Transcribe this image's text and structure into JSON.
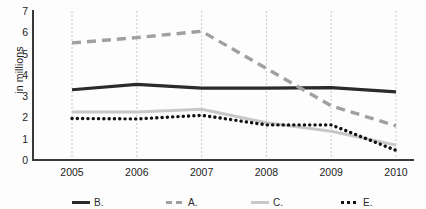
{
  "chart_data": {
    "type": "line",
    "title": "",
    "subtitle": "",
    "xlabel": "",
    "ylabel": "in millions",
    "categories": [
      "2005",
      "2006",
      "2007",
      "2008",
      "2009",
      "2010"
    ],
    "x": [
      2005,
      2006,
      2007,
      2008,
      2009,
      2010
    ],
    "ylim": [
      0,
      7
    ],
    "xlim": [
      2005,
      2010
    ],
    "yticks": [
      0,
      1,
      2,
      3,
      4,
      5,
      6,
      7
    ],
    "ytick_labels": [
      "0",
      "1",
      "2",
      "3",
      "4",
      "5",
      "6",
      "7"
    ],
    "xtick_labels": [
      "2005",
      "2006",
      "2007",
      "2008",
      "2009",
      "2010"
    ],
    "grid": "vertical-dashed-light",
    "legend_position": "bottom",
    "series": [
      {
        "name": "B.",
        "style": "solid",
        "color": "#2b2b2b",
        "width": 3.2,
        "values": [
          3.3,
          3.55,
          3.38,
          3.38,
          3.4,
          3.2
        ]
      },
      {
        "name": "A.",
        "style": "dashed",
        "color": "#a0a0a0",
        "width": 3.4,
        "values": [
          5.5,
          5.75,
          6.05,
          4.3,
          2.55,
          1.6
        ]
      },
      {
        "name": "C.",
        "style": "solid",
        "color": "#c8c8c8",
        "width": 3.0,
        "values": [
          2.25,
          2.25,
          2.38,
          1.75,
          1.35,
          0.7
        ]
      },
      {
        "name": "E.",
        "style": "dotted",
        "color": "#111111",
        "width": 3.4,
        "values": [
          1.95,
          1.93,
          2.1,
          1.65,
          1.65,
          0.45
        ]
      }
    ]
  },
  "legend": {
    "note": "legend labels clipped by image bottom edge",
    "items": [
      {
        "label": "B.",
        "style": "solid-dark",
        "x": 72
      },
      {
        "label": "A.",
        "style": "dashed-grey",
        "x": 166
      },
      {
        "label": "C.",
        "style": "solid-light",
        "x": 251
      },
      {
        "label": "E.",
        "style": "dotted-black",
        "x": 341
      }
    ]
  },
  "axes": {
    "y_axis_label": "in millions",
    "y_min_label": "0",
    "y_max_label": "7"
  },
  "colors": {
    "series_dark": "#2b2b2b",
    "series_grey_dashed": "#a0a0a0",
    "series_light_grey": "#c8c8c8",
    "series_black_dotted": "#111111",
    "axis": "#3a3a3a",
    "grid": "#c9c9c9",
    "background": "#fdfdfd"
  }
}
